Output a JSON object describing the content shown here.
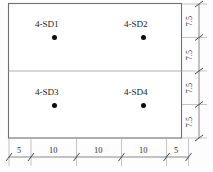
{
  "drawing": {
    "title": "Sensor layout plan",
    "slab": {
      "outline_color": "#6e6e6e",
      "divider_color": "#9a9a9a",
      "fill_color": "#ffffff"
    },
    "sensors": [
      {
        "label": "4-SD1",
        "x_units": 10,
        "y_units": 7.5
      },
      {
        "label": "4-SD2",
        "x_units": 30,
        "y_units": 7.5
      },
      {
        "label": "4-SD3",
        "x_units": 10,
        "y_units": 22.5
      },
      {
        "label": "4-SD4",
        "x_units": 30,
        "y_units": 22.5
      }
    ],
    "bottom_dimensions": {
      "name": "horizontal-dimension-chain",
      "segments": [
        "5",
        "10",
        "10",
        "10",
        "5"
      ],
      "total": 40
    },
    "right_dimensions": {
      "name": "vertical-dimension-chain",
      "segments": [
        "7.5",
        "7.5",
        "7.5",
        "7.5"
      ],
      "total": 30
    }
  }
}
